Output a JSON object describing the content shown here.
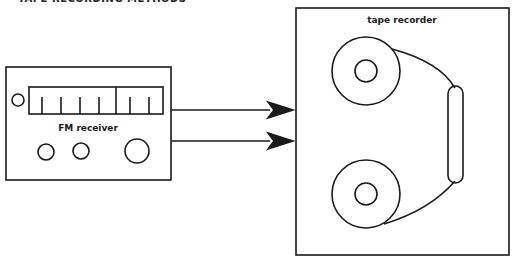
{
  "header": {
    "title": "TAPE RECORDING METHODS"
  },
  "diagram": {
    "source_device": {
      "label": "FM receiver"
    },
    "target_device": {
      "label": "tape recorder"
    },
    "connections": [
      {
        "from": "FM receiver",
        "to": "tape recorder",
        "type": "arrow"
      },
      {
        "from": "FM receiver",
        "to": "tape recorder",
        "type": "arrow"
      }
    ]
  },
  "colors": {
    "stroke": "#1a1a1a",
    "background": "#ffffff"
  }
}
